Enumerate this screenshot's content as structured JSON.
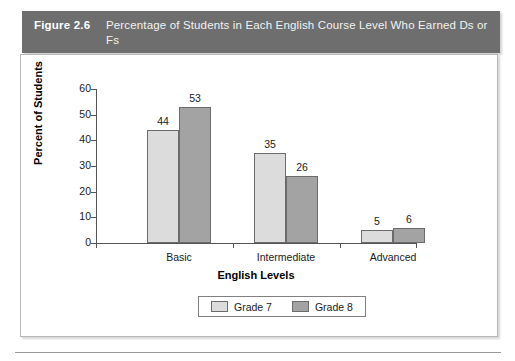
{
  "figure": {
    "label": "Figure 2.6",
    "caption": "Percentage of Students in Each English Course Level Who Earned Ds or Fs"
  },
  "colors": {
    "banner_bg": "#6e6e6e",
    "banner_text": "#ffffff",
    "series_1": "#dcdcdc",
    "series_2": "#a3a3a3",
    "axis": "#555555",
    "frame_border": "#b8b8b8"
  },
  "chart_data": {
    "type": "bar",
    "title": "Percentage of Students in Each English Course Level Who Earned Ds or Fs",
    "categories": [
      "Basic",
      "Intermediate",
      "Advanced"
    ],
    "series": [
      {
        "name": "Grade 7",
        "values": [
          44,
          35,
          5
        ],
        "color": "#dcdcdc"
      },
      {
        "name": "Grade 8",
        "values": [
          53,
          26,
          6
        ],
        "color": "#a3a3a3"
      }
    ],
    "xlabel": "English Levels",
    "ylabel": "Percent of Students",
    "ylim": [
      0,
      60
    ],
    "yticks": [
      0,
      10,
      20,
      30,
      40,
      50,
      60
    ],
    "ytick_labels": [
      "0",
      "10",
      "20",
      "30",
      "40",
      "50",
      "60"
    ],
    "grid": false,
    "legend_position": "bottom-center",
    "data_labels": true
  }
}
